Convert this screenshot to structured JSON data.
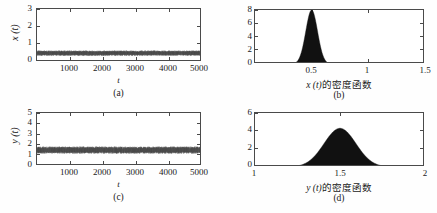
{
  "figure": {
    "background": "#fefefe",
    "axis_color": "#4a4a4a",
    "data_color": "#111111",
    "noise_color": "#565656"
  },
  "panels": [
    {
      "id": "a",
      "caption": "(a)",
      "xlabel": "t",
      "ylabel": "x (t)",
      "ylabel_plain": "x(t)",
      "x_ticks": [
        "1000",
        "2000",
        "3000",
        "4000",
        "5000"
      ],
      "y_ticks": [
        "0",
        "1",
        "2",
        "3"
      ]
    },
    {
      "id": "b",
      "caption": "(b)",
      "xlabel_var": "x (t)",
      "xlabel_cn": "的密度函数",
      "ylabel": "",
      "x_ticks": [
        "0.5",
        "1",
        "1.5"
      ],
      "y_ticks": [
        "0",
        "2",
        "4",
        "6",
        "8"
      ]
    },
    {
      "id": "c",
      "caption": "(c)",
      "xlabel": "t",
      "ylabel": "y (t)",
      "ylabel_plain": "y(t)",
      "x_ticks": [
        "1000",
        "2000",
        "3000",
        "4000",
        "5000"
      ],
      "y_ticks": [
        "0",
        "1",
        "2",
        "3",
        "4",
        "5"
      ]
    },
    {
      "id": "d",
      "caption": "(d)",
      "xlabel_var": "y (t)",
      "xlabel_cn": "的密度函数",
      "ylabel": "",
      "x_ticks": [
        "1",
        "1.5",
        "2"
      ],
      "y_ticks": [
        "0",
        "2",
        "4",
        "6"
      ]
    }
  ],
  "chart_data": [
    {
      "type": "line",
      "panel": "a",
      "title": "",
      "xlabel": "t",
      "ylabel": "x (t)",
      "xlim": [
        0,
        5000
      ],
      "ylim": [
        0,
        3
      ],
      "xticks": [
        1000,
        2000,
        3000,
        4000,
        5000
      ],
      "yticks": [
        0,
        1,
        2,
        3
      ],
      "grid": false,
      "description": "Stationary noisy time series of x(t) fluctuating in a narrow band around 0.5",
      "series": [
        {
          "name": "x(t)",
          "mean": 0.5,
          "band_min": 0.38,
          "band_max": 0.62,
          "color": "#565656"
        }
      ]
    },
    {
      "type": "area",
      "panel": "b",
      "title": "",
      "xlabel": "x (t) 的密度函数",
      "ylabel": "",
      "xlim": [
        0,
        1.5
      ],
      "ylim": [
        0,
        8
      ],
      "xticks": [
        0.5,
        1,
        1.5
      ],
      "yticks": [
        0,
        2,
        4,
        6,
        8
      ],
      "grid": false,
      "description": "Probability density function of x(t): narrow unimodal peak centered at 0.5 with maximum density 8.0",
      "series": [
        {
          "name": "density of x(t)",
          "peak_x": 0.5,
          "peak_y": 8.0,
          "sigma": 0.052,
          "color": "#111111",
          "x": [
            0.2,
            0.25,
            0.28,
            0.3,
            0.32,
            0.34,
            0.36,
            0.38,
            0.4,
            0.42,
            0.44,
            0.46,
            0.48,
            0.5,
            0.52,
            0.54,
            0.56,
            0.58,
            0.6,
            0.62,
            0.64,
            0.66,
            0.68,
            0.7,
            0.75,
            0.8,
            0.9,
            1.0,
            1.5
          ],
          "y": [
            0.0,
            0.02,
            0.08,
            0.18,
            0.36,
            0.68,
            1.2,
            2.0,
            3.1,
            4.5,
            5.9,
            7.1,
            7.85,
            8.0,
            7.6,
            6.6,
            5.2,
            3.8,
            2.5,
            1.55,
            0.9,
            0.48,
            0.24,
            0.12,
            0.03,
            0.01,
            0.0,
            0.0,
            0.0
          ]
        }
      ]
    },
    {
      "type": "line",
      "panel": "c",
      "title": "",
      "xlabel": "t",
      "ylabel": "y (t)",
      "xlim": [
        0,
        5000
      ],
      "ylim": [
        0,
        5
      ],
      "xticks": [
        1000,
        2000,
        3000,
        4000,
        5000
      ],
      "yticks": [
        0,
        1,
        2,
        3,
        4,
        5
      ],
      "grid": false,
      "description": "Stationary noisy time series of y(t) fluctuating in a band around 1.5",
      "series": [
        {
          "name": "y(t)",
          "mean": 1.5,
          "band_min": 1.25,
          "band_max": 1.8,
          "color": "#565656"
        }
      ]
    },
    {
      "type": "area",
      "panel": "d",
      "title": "",
      "xlabel": "y (t) 的密度函数",
      "ylabel": "",
      "xlim": [
        1,
        2
      ],
      "ylim": [
        0,
        6
      ],
      "xticks": [
        1,
        1.5,
        2
      ],
      "yticks": [
        0,
        2,
        4,
        6
      ],
      "grid": false,
      "description": "Probability density function of y(t): broad unimodal bell centered at 1.5 with maximum density about 4.3",
      "series": [
        {
          "name": "density of y(t)",
          "peak_x": 1.5,
          "peak_y": 4.3,
          "sigma": 0.094,
          "color": "#111111",
          "x": [
            1.0,
            1.1,
            1.15,
            1.2,
            1.24,
            1.28,
            1.32,
            1.36,
            1.4,
            1.44,
            1.48,
            1.5,
            1.52,
            1.56,
            1.6,
            1.64,
            1.68,
            1.72,
            1.76,
            1.8,
            1.85,
            1.9,
            1.95,
            2.0
          ],
          "y": [
            0.0,
            0.02,
            0.06,
            0.16,
            0.34,
            0.66,
            1.15,
            1.85,
            2.7,
            3.55,
            4.18,
            4.3,
            4.26,
            3.85,
            3.15,
            2.35,
            1.6,
            1.0,
            0.58,
            0.3,
            0.12,
            0.04,
            0.01,
            0.0
          ]
        }
      ]
    }
  ]
}
